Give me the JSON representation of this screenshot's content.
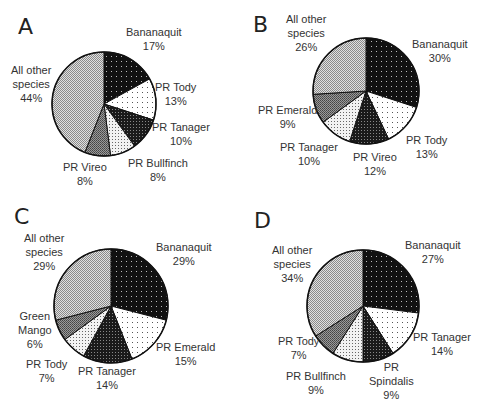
{
  "chart_data": [
    {
      "type": "pie",
      "title": "A",
      "categories": [
        "Bananaquit",
        "PR Tody",
        "PR Tanager",
        "PR Bullfinch",
        "PR Vireo",
        "All other species"
      ],
      "values": [
        17,
        13,
        10,
        8,
        8,
        44
      ],
      "labels": [
        "17%",
        "13%",
        "10%",
        "8%",
        "8%",
        "44%"
      ]
    },
    {
      "type": "pie",
      "title": "B",
      "categories": [
        "Bananaquit",
        "PR Tody",
        "PR Vireo",
        "PR Tanager",
        "PR Emerald",
        "All other species"
      ],
      "values": [
        30,
        13,
        12,
        10,
        9,
        26
      ],
      "labels": [
        "30%",
        "13%",
        "12%",
        "10%",
        "9%",
        "26%"
      ]
    },
    {
      "type": "pie",
      "title": "C",
      "categories": [
        "Bananaquit",
        "PR Emerald",
        "PR Tanager",
        "PR Tody",
        "Green Mango",
        "All other species"
      ],
      "values": [
        29,
        15,
        14,
        7,
        6,
        29
      ],
      "labels": [
        "29%",
        "15%",
        "14%",
        "7%",
        "6%",
        "29%"
      ]
    },
    {
      "type": "pie",
      "title": "D",
      "categories": [
        "Bananaquit",
        "PR Tanager",
        "PR Spindalis",
        "PR Bullfinch",
        "PR Tody",
        "All other species"
      ],
      "values": [
        27,
        14,
        9,
        9,
        7,
        34
      ],
      "labels": [
        "27%",
        "14%",
        "9%",
        "9%",
        "7%",
        "34%"
      ]
    }
  ],
  "panels": {
    "A": {
      "letter": "A",
      "labels": [
        {
          "l1": "Bananaquit",
          "l2": "17%"
        },
        {
          "l1": "PR Tody",
          "l2": "13%"
        },
        {
          "l1": "PR Tanager",
          "l2": "10%"
        },
        {
          "l1": "PR Bullfinch",
          "l2": "8%"
        },
        {
          "l1": "PR Vireo",
          "l2": "8%"
        },
        {
          "l1": "All other",
          "l2": "species",
          "l3": "44%"
        }
      ]
    },
    "B": {
      "letter": "B",
      "labels": [
        {
          "l1": "Bananaquit",
          "l2": "30%"
        },
        {
          "l1": "PR Tody",
          "l2": "13%"
        },
        {
          "l1": "PR Vireo",
          "l2": "12%"
        },
        {
          "l1": "PR Tanager",
          "l2": "10%"
        },
        {
          "l1": "PR Emerald",
          "l2": "9%"
        },
        {
          "l1": "All other",
          "l2": "species",
          "l3": "26%"
        }
      ]
    },
    "C": {
      "letter": "C",
      "labels": [
        {
          "l1": "Bananaquit",
          "l2": "29%"
        },
        {
          "l1": "PR Emerald",
          "l2": "15%"
        },
        {
          "l1": "PR Tanager",
          "l2": "14%"
        },
        {
          "l1": "PR Tody",
          "l2": "7%"
        },
        {
          "l1": "Green",
          "l2": "Mango",
          "l3": "6%"
        },
        {
          "l1": "All other",
          "l2": "species",
          "l3": "29%"
        }
      ]
    },
    "D": {
      "letter": "D",
      "labels": [
        {
          "l1": "Bananaquit",
          "l2": "27%"
        },
        {
          "l1": "PR Tanager",
          "l2": "14%"
        },
        {
          "l1": "PR",
          "l2": "Spindalis",
          "l3": "9%"
        },
        {
          "l1": "PR Bullfinch",
          "l2": "9%"
        },
        {
          "l1": "PR Tody",
          "l2": "7%"
        },
        {
          "l1": "All other",
          "l2": "species",
          "l3": "34%"
        }
      ]
    }
  },
  "fills": {
    "black_dots": "#111111",
    "white_dots": "#ffffff",
    "dark_check": "#2a2a2a",
    "light_dots": "#e8e8e8",
    "mid_gray": "#777777",
    "light_check": "#bdbdbd"
  }
}
